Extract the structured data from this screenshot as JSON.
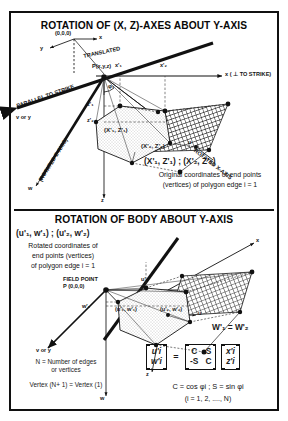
{
  "figure": {
    "panels": [
      {
        "id": "top",
        "title": "ROTATION OF (X, Z)-AXES ABOUT  Y-AXIS",
        "labels": {
          "origin": "(0,0,0)",
          "axis_x": "x",
          "axis_y": "y",
          "translated": "TRANSLATED",
          "parallel_to_strike": "PARALLEL TO STRIKE",
          "v_or_y": "v or y",
          "field_point": "P(x,y,z)",
          "phi": "φ₁",
          "xp1": "x'₁",
          "xp2": "x'₂",
          "zp1": "z'₁",
          "zp2": "z'₂",
          "axis_x_perp": "x ( ⊥ TO STRIKE)",
          "rotated_z_axis": "(ROTATED Z-AXIS)",
          "rotated_x_axis": "ROTATED X-AXIS",
          "u": "u",
          "axis_z": "z",
          "axis_w": "w",
          "vertex_1": "(X'₁, Z'₁)",
          "vertex_2": "(X'₂, Z'₂)"
        },
        "caption": {
          "line1": "(X'₁, Z'₁)  ;  (X'₂, Z'₂)",
          "line2": "Original coordinates of end points",
          "line3": "(vertices) of polygon edge i = 1"
        }
      },
      {
        "id": "bottom",
        "title": "ROTATION OF BODY ABOUT  Y-AXIS",
        "labels": {
          "field_point_title": "FIELD POINT",
          "field_point_coords": "P (0,0,0)",
          "axis_x": "x",
          "axis_u": "u",
          "axis_z": "z",
          "axis_w": "w",
          "v_or_y": "v or y",
          "wp1_axis": "w'₁",
          "up1_axis": "u'₁",
          "vertex_1": "(u'₁, w'₁)",
          "vertex_2": "(u'₂, w'₂)",
          "equal_note": "W'₁ = W'₂"
        },
        "caption": {
          "line1": "(u'₁, w'₁)  ;  (u'₂, w'₂)",
          "line2": "Rotated coordinates of",
          "line3": "end points (vertices)",
          "line4": "of polygon edge i = 1"
        },
        "notes": {
          "line1": "N = Number of edges",
          "line2": "or vertices",
          "line3": "Vertex (N+ 1) = Vertex (1)"
        },
        "equation": {
          "lhs_row1": "u'i",
          "lhs_row2": "w'i",
          "equals": "=",
          "m_r1c1": "C",
          "m_r1c2": "S",
          "m_r2c1": "-S",
          "m_r2c2": "C",
          "rhs_row1": "x'i",
          "rhs_row2": "z'i",
          "definition": "C = cos φi ;  S = sin φi",
          "range": "(i = 1, 2, ...., N)"
        }
      }
    ],
    "colors": {
      "ink": "#101010",
      "paper": "#ffffff",
      "stipple": "#9a9a9a"
    }
  }
}
